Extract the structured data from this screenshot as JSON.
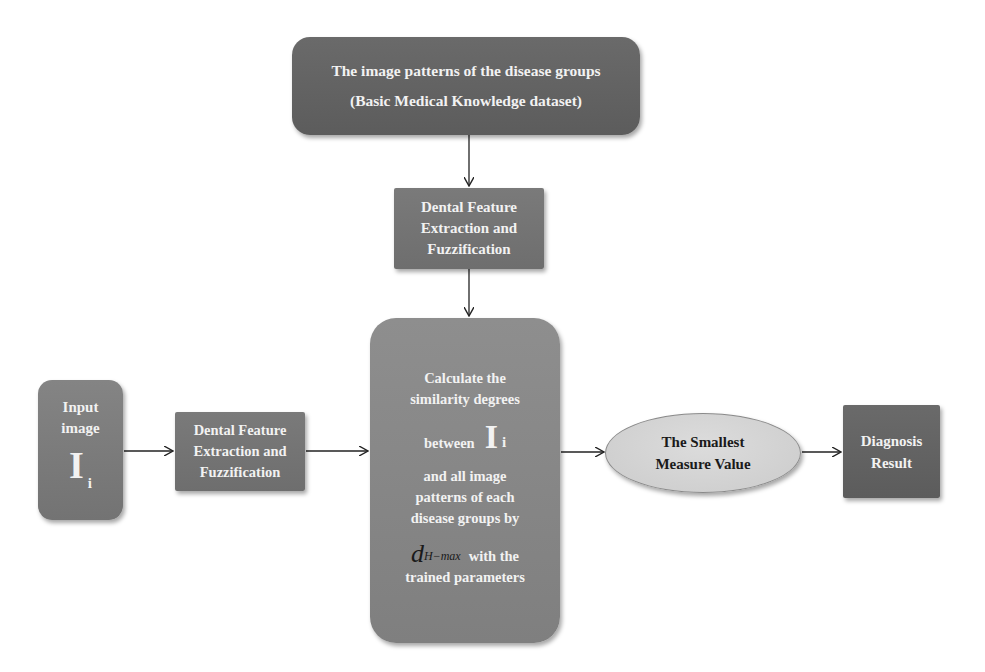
{
  "diagram": {
    "nodes": {
      "knowledge": {
        "line1": "The image patterns of the disease groups",
        "line2": "(Basic Medical Knowledge dataset)"
      },
      "feature_top": {
        "lines": [
          "Dental Feature",
          "Extraction and",
          "Fuzzification"
        ]
      },
      "input": {
        "lines": [
          "Input",
          "image"
        ],
        "symbol": "I",
        "subscript": "i"
      },
      "feature_left": {
        "lines": [
          "Dental Feature",
          "Extraction and",
          "Fuzzification"
        ]
      },
      "calculate": {
        "lines_top": [
          "Calculate the",
          "similarity degrees"
        ],
        "between": "between",
        "symbol": "I",
        "subscript": "i",
        "lines_mid": [
          "and all image",
          "patterns of each",
          "disease groups by"
        ],
        "measure_symbol": "d",
        "measure_subscript": "H−max",
        "with_text": "with the",
        "last_line": "trained parameters"
      },
      "smallest": {
        "lines": [
          "The Smallest",
          "Measure Value"
        ]
      },
      "diagnosis": {
        "lines": [
          "Diagnosis",
          "Result"
        ]
      }
    },
    "edges": [
      {
        "from": "knowledge",
        "to": "feature_top"
      },
      {
        "from": "feature_top",
        "to": "calculate"
      },
      {
        "from": "input",
        "to": "feature_left"
      },
      {
        "from": "feature_left",
        "to": "calculate"
      },
      {
        "from": "calculate",
        "to": "smallest"
      },
      {
        "from": "smallest",
        "to": "diagnosis"
      }
    ],
    "colors": {
      "dark_box": "#616161",
      "mid_box": "#787878",
      "light_box": "#868686",
      "ellipse_fill": "#d2d2d2",
      "box_text": "#f2f2f2",
      "ellipse_text": "#1a1a1a",
      "arrow": "#222222"
    }
  }
}
